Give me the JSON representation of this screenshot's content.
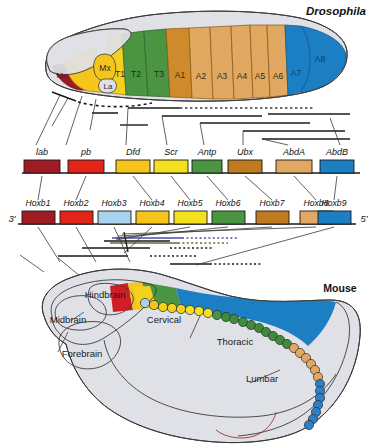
{
  "figure": {
    "title_drosophila": "Drosophila",
    "title_mouse": "Mouse"
  },
  "drosophila_embryo": {
    "segments": [
      {
        "label": "Mn",
        "color": "#9e1b22"
      },
      {
        "label": "Mx",
        "color": "#f6c51c"
      },
      {
        "label": "La",
        "color": "#f6c51c"
      },
      {
        "label": "T1",
        "color": "#f3d11e"
      },
      {
        "label": "T2",
        "color": "#4a9442"
      },
      {
        "label": "T3",
        "color": "#4a9442"
      },
      {
        "label": "A1",
        "color": "#cf8a2b"
      },
      {
        "label": "A2",
        "color": "#e0a860"
      },
      {
        "label": "A3",
        "color": "#e0a860"
      },
      {
        "label": "A4",
        "color": "#e0a860"
      },
      {
        "label": "A5",
        "color": "#e0a860"
      },
      {
        "label": "A6",
        "color": "#e0a860"
      },
      {
        "label": "A7",
        "color": "#1c7fc4"
      },
      {
        "label": "A8",
        "color": "#1c7fc4"
      }
    ],
    "body_color": "#dfe1e6"
  },
  "hom_c_cluster": {
    "genes": [
      {
        "name": "lab",
        "color": "#a01c24"
      },
      {
        "name": "pb",
        "color": "#e32419"
      },
      {
        "name": "Dfd",
        "color": "#f6c51c"
      },
      {
        "name": "Scr",
        "color": "#f3e01e"
      },
      {
        "name": "Antp",
        "color": "#4a9442"
      },
      {
        "name": "Ubx",
        "color": "#c27a21"
      },
      {
        "name": "AbdA",
        "color": "#e0a860"
      },
      {
        "name": "AbdB",
        "color": "#1c7fc4"
      }
    ]
  },
  "hoxb_cluster": {
    "end_left": "3'",
    "end_right": "5'",
    "genes": [
      {
        "name": "Hoxb1",
        "color": "#a01c24"
      },
      {
        "name": "Hoxb2",
        "color": "#e32419"
      },
      {
        "name": "Hoxb3",
        "color": "#a8d2ee"
      },
      {
        "name": "Hoxb4",
        "color": "#f6c51c"
      },
      {
        "name": "Hoxb5",
        "color": "#f3e01e"
      },
      {
        "name": "Hoxb6",
        "color": "#4a9442"
      },
      {
        "name": "Hoxb7",
        "color": "#c27a21"
      },
      {
        "name": "Hoxb8",
        "color": "#e0a860"
      },
      {
        "name": "Hoxb9",
        "color": "#1c7fc4"
      }
    ]
  },
  "mouse_embryo": {
    "body_color": "#dfe1e6",
    "brain_regions": [
      {
        "label": "Forebrain"
      },
      {
        "label": "Midbrain"
      },
      {
        "label": "Hindbrain"
      }
    ],
    "axial_regions": [
      {
        "label": "Cervical"
      },
      {
        "label": "Thoracic"
      },
      {
        "label": "Lumbar"
      }
    ],
    "neural_tube_bands": [
      {
        "color": "#cf1f26"
      },
      {
        "color": "#f6c51c"
      },
      {
        "color": "#4a9442"
      },
      {
        "color": "#1c7fc4"
      }
    ],
    "somites": [
      {
        "color": "#a8d2ee"
      },
      {
        "color": "#f6c51c"
      },
      {
        "color": "#f3d11e"
      },
      {
        "color": "#f3d11e"
      },
      {
        "color": "#f3d11e"
      },
      {
        "color": "#f3e01e"
      },
      {
        "color": "#f3e01e"
      },
      {
        "color": "#f3e01e"
      },
      {
        "color": "#4a9442"
      },
      {
        "color": "#3f8a3c"
      },
      {
        "color": "#3f8a3c"
      },
      {
        "color": "#3f8a3c"
      },
      {
        "color": "#3f8a3c"
      },
      {
        "color": "#3f8a3c"
      },
      {
        "color": "#3f8a3c"
      },
      {
        "color": "#3f8a3c"
      },
      {
        "color": "#3f8a3c"
      },
      {
        "color": "#3f8a3c"
      },
      {
        "color": "#e0a860"
      },
      {
        "color": "#e0a860"
      },
      {
        "color": "#e0a860"
      },
      {
        "color": "#e0a860"
      },
      {
        "color": "#e0a860"
      },
      {
        "color": "#e0a860"
      },
      {
        "color": "#2f7fc4"
      },
      {
        "color": "#2f7fc4"
      },
      {
        "color": "#2f7fc4"
      },
      {
        "color": "#2f7fc4"
      },
      {
        "color": "#2f7fc4"
      },
      {
        "color": "#2f7fc4"
      },
      {
        "color": "#2f7fc4"
      }
    ]
  }
}
